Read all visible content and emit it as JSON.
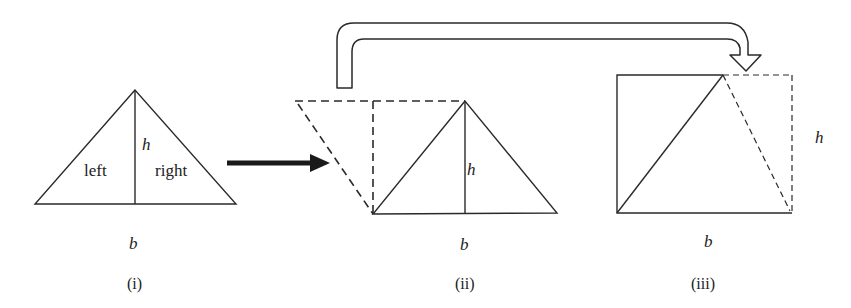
{
  "figures": [
    {
      "id": "i",
      "caption": "(i)",
      "base_label": "b",
      "height_label": "h",
      "left_label": "left",
      "right_label": "right"
    },
    {
      "id": "ii",
      "caption": "(ii)",
      "base_label": "b",
      "height_label": "h"
    },
    {
      "id": "iii",
      "caption": "(iii)",
      "base_label": "b",
      "height_label": "h"
    }
  ],
  "colors": {
    "stroke": "#2a2a2a",
    "background": "#ffffff"
  }
}
